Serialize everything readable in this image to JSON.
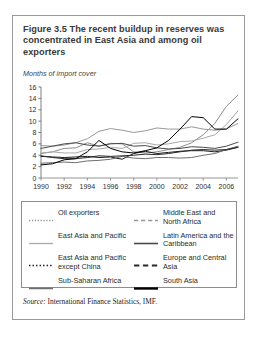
{
  "figure": {
    "title": "Figure 3.5  The recent buildup in reserves was concentrated in East Asia and among oil exporters",
    "source_prefix": "Source:",
    "source_text": " International Finance Statistics, IMF."
  },
  "legend": {
    "left": [
      {
        "label": "Oil exporters",
        "style": "dotted",
        "color": "#8c8c8c",
        "width": 1.3
      },
      {
        "label": "East Asia and Pacific",
        "style": "solid",
        "color": "#a8a8a8",
        "width": 1.3
      },
      {
        "label": "East Asia and Pacific except China",
        "style": "dotted",
        "color": "#1c1c1c",
        "width": 1.6
      },
      {
        "label": "Sub-Saharan Africa",
        "style": "solid",
        "color": "#6f6f6f",
        "width": 1.5
      }
    ],
    "right": [
      {
        "label": "Middle East and North Africa",
        "style": "dashed",
        "color": "#999999",
        "width": 1.5
      },
      {
        "label": "Latin America and the Caribbean",
        "style": "solid",
        "color": "#4a4a4a",
        "width": 1.6
      },
      {
        "label": "Europe and Central Asia",
        "style": "dashed",
        "color": "#2a2a2a",
        "width": 1.9
      },
      {
        "label": "South Asia",
        "style": "solid",
        "color": "#000000",
        "width": 2.4
      }
    ]
  },
  "chart_data": {
    "type": "line",
    "title": "Figure 3.5  The recent buildup in reserves was concentrated in East Asia and among oil exporters",
    "ylabel": "Months of import cover",
    "xlabel": "",
    "ylim": [
      0,
      16
    ],
    "ytick_step": 2,
    "yticks": [
      0,
      2,
      4,
      6,
      8,
      10,
      12,
      14,
      16
    ],
    "xlim": [
      1990,
      2007
    ],
    "xticks": [
      1990,
      1992,
      1994,
      1996,
      1998,
      2000,
      2002,
      2004,
      2006
    ],
    "x": [
      1990,
      1991,
      1992,
      1993,
      1994,
      1995,
      1996,
      1997,
      1998,
      1999,
      2000,
      2001,
      2002,
      2003,
      2004,
      2005,
      2006,
      2007
    ],
    "grid": false,
    "legend_position": "below-plot",
    "series": [
      {
        "name": "Oil exporters",
        "style": "dotted",
        "color": "#8c8c8c",
        "values": [
          4.3,
          4.6,
          5.2,
          5.3,
          6.2,
          5.6,
          6.1,
          6.0,
          4.6,
          4.4,
          4.6,
          5.0,
          5.4,
          6.2,
          7.6,
          9.6,
          12.6,
          14.6
        ]
      },
      {
        "name": "East Asia and Pacific",
        "style": "solid",
        "color": "#a8a8a8",
        "values": [
          4.4,
          4.6,
          4.4,
          4.4,
          5.0,
          5.1,
          5.4,
          5.2,
          6.1,
          6.2,
          5.8,
          6.0,
          6.4,
          6.5,
          7.0,
          7.6,
          9.4,
          11.8
        ]
      },
      {
        "name": "East Asia and Pacific except China",
        "style": "dotted",
        "color": "#1c1c1c",
        "values": [
          3.8,
          3.7,
          3.6,
          3.7,
          3.8,
          3.6,
          3.7,
          3.3,
          4.3,
          4.7,
          4.3,
          4.5,
          4.7,
          4.8,
          4.8,
          4.6,
          4.9,
          5.4
        ]
      },
      {
        "name": "Sub-Saharan Africa",
        "style": "solid",
        "color": "#6f6f6f",
        "values": [
          2.6,
          2.7,
          2.8,
          2.7,
          3.0,
          3.1,
          3.3,
          3.8,
          3.5,
          3.4,
          3.6,
          3.6,
          3.5,
          3.6,
          4.0,
          4.3,
          5.0,
          5.6
        ]
      },
      {
        "name": "Middle East and North Africa",
        "style": "dashed",
        "color": "#999999",
        "values": [
          5.7,
          5.6,
          5.8,
          6.2,
          6.9,
          8.2,
          8.7,
          8.4,
          8.0,
          8.3,
          8.8,
          8.6,
          8.6,
          9.0,
          8.6,
          8.4,
          8.6,
          9.6
        ]
      },
      {
        "name": "Latin America and the Caribbean",
        "style": "solid",
        "color": "#4a4a4a",
        "values": [
          5.2,
          5.6,
          6.0,
          6.2,
          5.8,
          5.6,
          6.0,
          6.1,
          5.6,
          5.7,
          5.3,
          5.1,
          5.2,
          5.5,
          5.4,
          5.2,
          5.6,
          6.3
        ]
      },
      {
        "name": "Europe and Central Asia",
        "style": "dashed",
        "color": "#2a2a2a",
        "values": [
          3.9,
          3.6,
          3.4,
          3.4,
          3.6,
          3.9,
          3.8,
          3.9,
          4.0,
          4.2,
          4.1,
          4.3,
          4.6,
          4.9,
          5.0,
          4.9,
          5.0,
          5.4
        ]
      },
      {
        "name": "South Asia",
        "style": "solid",
        "color": "#000000",
        "values": [
          2.3,
          2.5,
          3.2,
          3.4,
          4.6,
          6.6,
          5.2,
          4.6,
          4.4,
          4.8,
          5.3,
          6.6,
          8.6,
          10.8,
          10.6,
          8.6,
          8.6,
          10.4
        ]
      }
    ]
  }
}
